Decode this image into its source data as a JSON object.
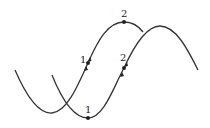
{
  "diagram": {
    "stroke_color": "#333333",
    "waves": [
      {
        "name": "wave-a",
        "path": "M15,70 C28,100 40,114 52,113 C68,112 80,80 88,63 C98,40 108,22 124,22 C134,22 140,28 143,32"
      },
      {
        "name": "wave-b",
        "path": "M52,75 C62,100 74,118 88,118 C104,118 114,86 124,68 C134,46 146,26 160,26 C176,26 188,50 198,70"
      }
    ],
    "points": [
      {
        "label": "1",
        "x": 88,
        "y": 63,
        "lx": 80,
        "ly": 63
      },
      {
        "label": "2",
        "x": 124,
        "y": 22,
        "lx": 121,
        "ly": 17
      },
      {
        "label": "2",
        "x": 124,
        "y": 68,
        "lx": 120,
        "ly": 61
      },
      {
        "label": "1",
        "x": 88,
        "y": 118,
        "lx": 85,
        "ly": 113
      }
    ]
  }
}
